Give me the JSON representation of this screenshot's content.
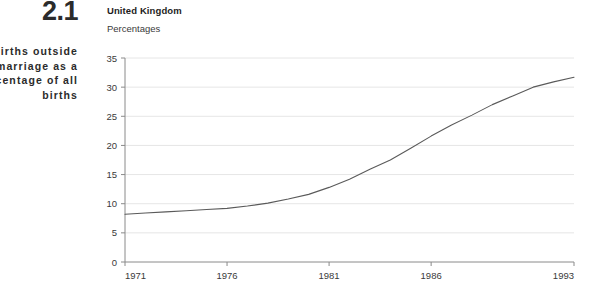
{
  "figure": {
    "number": "2.1",
    "caption": "Live births outside marriage as a percentage of all births"
  },
  "chart_header": {
    "country": "United Kingdom",
    "units": "Percentages"
  },
  "chart_data": {
    "type": "line",
    "title": "United Kingdom",
    "subtitle": "Percentages",
    "xlabel": "",
    "ylabel": "Percentages",
    "xlim": [
      1971,
      1993
    ],
    "ylim": [
      0,
      35
    ],
    "ytick_labels": [
      "0",
      "5",
      "10",
      "15",
      "20",
      "25",
      "30",
      "35"
    ],
    "yticks": [
      0,
      5,
      10,
      15,
      20,
      25,
      30,
      35
    ],
    "xtick_labels": [
      "1971",
      "1976",
      "1981",
      "1986",
      "1993"
    ],
    "xticks": [
      1971,
      1976,
      1981,
      1986,
      1993
    ],
    "grid": "horizontal",
    "legend": "none",
    "line_color": "#5a5a5a",
    "series": [
      {
        "name": "Live births outside marriage",
        "x": [
          1971,
          1972,
          1973,
          1974,
          1975,
          1976,
          1977,
          1978,
          1979,
          1980,
          1981,
          1982,
          1983,
          1984,
          1985,
          1986,
          1987,
          1988,
          1989,
          1990,
          1991,
          1992,
          1993
        ],
        "values": [
          8.2,
          8.4,
          8.6,
          8.8,
          9.0,
          9.2,
          9.6,
          10.1,
          10.8,
          11.6,
          12.8,
          14.2,
          15.9,
          17.5,
          19.5,
          21.6,
          23.5,
          25.2,
          27.0,
          28.5,
          30.0,
          30.9,
          31.7
        ]
      }
    ]
  },
  "axis_colors": {
    "grid": "#e6e6e6",
    "axis": "#8a8a8a",
    "line": "#5a5a5a"
  }
}
